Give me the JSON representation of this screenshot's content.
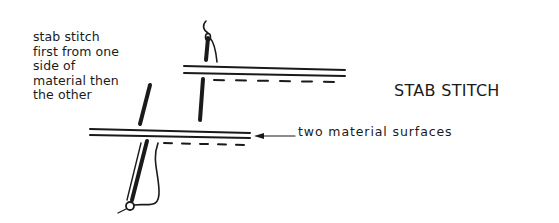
{
  "diagram": {
    "title": "STAB STITCH",
    "instruction_lines": [
      "stab stitch",
      "first from one",
      "side of",
      "material then",
      "the other"
    ],
    "pointer_label": "two material surfaces",
    "colors": {
      "ink": "#1a1a1a",
      "background": "#ffffff"
    }
  }
}
